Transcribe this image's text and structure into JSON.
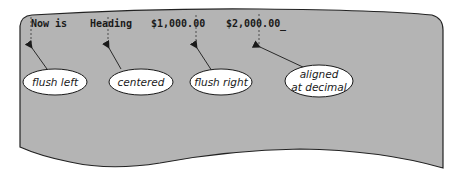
{
  "screen": {
    "background": "#ffffff",
    "panel_color": "#b4b4b4",
    "outline_color": "#222222"
  },
  "text_line": {
    "items": [
      {
        "id": "flush-left",
        "text": "Now is"
      },
      {
        "id": "centered",
        "text": "Heading"
      },
      {
        "id": "flush-right",
        "text": "$1,000.00"
      },
      {
        "id": "decimal",
        "text": "$2,000.00"
      },
      {
        "id": "cursor",
        "text": "_"
      }
    ]
  },
  "callouts": [
    {
      "id": "flush-left",
      "lines": [
        "flush left"
      ]
    },
    {
      "id": "centered",
      "lines": [
        "centered"
      ]
    },
    {
      "id": "flush-right",
      "lines": [
        "flush right"
      ]
    },
    {
      "id": "decimal",
      "lines": [
        "aligned",
        "at decimal"
      ]
    }
  ]
}
